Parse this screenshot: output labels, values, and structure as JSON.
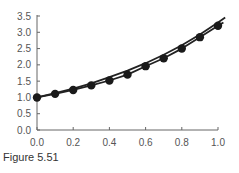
{
  "chart_data": {
    "type": "line",
    "title": "",
    "xlabel": "",
    "ylabel": "",
    "xlim": [
      0.0,
      1.0
    ],
    "ylim": [
      0.0,
      3.5
    ],
    "x_ticks": [
      "0.0",
      "0.2",
      "0.4",
      "0.6",
      "0.8",
      "1.0"
    ],
    "y_ticks": [
      "0.0",
      "0.5",
      "1.0",
      "1.5",
      "2.0",
      "2.5",
      "3.0",
      "3.5"
    ],
    "grid": false,
    "legend": "none",
    "series": [
      {
        "name": "exact solution",
        "style": "line",
        "x": [
          0.0,
          0.1,
          0.2,
          0.3,
          0.4,
          0.5,
          0.6,
          0.7,
          0.8,
          0.9,
          1.0,
          1.04
        ],
        "y": [
          1.0,
          1.13,
          1.27,
          1.43,
          1.62,
          1.82,
          2.05,
          2.31,
          2.6,
          2.93,
          3.3,
          3.45
        ]
      },
      {
        "name": "approximation",
        "style": "line-markers",
        "x": [
          0.0,
          0.1,
          0.2,
          0.3,
          0.4,
          0.5,
          0.6,
          0.7,
          0.8,
          0.9,
          1.0,
          1.03
        ],
        "y": [
          1.0,
          1.11,
          1.23,
          1.37,
          1.52,
          1.7,
          1.96,
          2.2,
          2.5,
          2.85,
          3.2,
          3.3
        ]
      }
    ]
  },
  "caption": "Figure 5.51"
}
